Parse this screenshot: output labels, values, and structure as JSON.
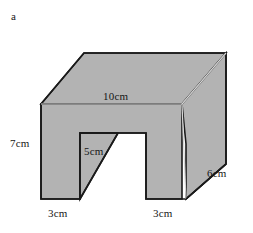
{
  "figure": {
    "part_label": "a",
    "caption": "",
    "colors": {
      "face_fill": "#b3b3b3",
      "outline": "#1a1a1a",
      "interior_edge": "#d6d6d6",
      "background": "#ffffff",
      "text": "#161616"
    },
    "dimensions": [
      {
        "id": "top-length",
        "value": "10",
        "unit": "cm",
        "text": "10cm",
        "edge": "top-front-horizontal"
      },
      {
        "id": "left-height",
        "value": "7",
        "unit": "cm",
        "text": "7cm",
        "edge": "front-left-vertical"
      },
      {
        "id": "notch-height",
        "value": "5",
        "unit": "cm",
        "text": "5cm",
        "edge": "notch-inner-vertical"
      },
      {
        "id": "depth",
        "value": "6",
        "unit": "cm",
        "text": "6cm",
        "edge": "right-bottom-diagonal"
      },
      {
        "id": "foot-left",
        "value": "3",
        "unit": "cm",
        "text": "3cm",
        "edge": "bottom-left-foot"
      },
      {
        "id": "foot-right",
        "value": "3",
        "unit": "cm",
        "text": "3cm",
        "edge": "bottom-right-foot"
      }
    ],
    "shape": {
      "type": "prism-with-rectangular-notch",
      "description": "3D solid drawn in oblique projection: an upside-down U shaped front face extruded backwards"
    }
  }
}
